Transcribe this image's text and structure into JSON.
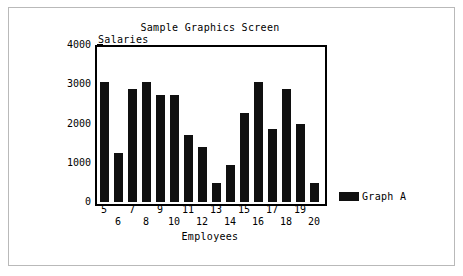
{
  "chart_data": {
    "type": "bar",
    "title": "Sample Graphics Screen",
    "xlabel": "Employees",
    "ylabel": "Salaries",
    "categories": [
      "5",
      "6",
      "7",
      "8",
      "9",
      "10",
      "11",
      "12",
      "13",
      "14",
      "15",
      "16",
      "17",
      "18",
      "19",
      "20"
    ],
    "values": [
      3050,
      1250,
      2880,
      3050,
      2720,
      2720,
      1700,
      1400,
      480,
      940,
      2280,
      3050,
      1850,
      2880,
      2000,
      480
    ],
    "series": [
      {
        "name": "Graph A",
        "color": "#101010",
        "values": [
          3050,
          1250,
          2880,
          3050,
          2720,
          2720,
          1700,
          1400,
          480,
          940,
          2280,
          3050,
          1850,
          2880,
          2000,
          480
        ]
      }
    ],
    "ylim": [
      0,
      4000
    ],
    "yticks": [
      0,
      1000,
      2000,
      3000,
      4000
    ],
    "ytick_labels": [
      "0",
      "1000",
      "2000",
      "3000",
      "4000"
    ],
    "y_minor_tick_interval": 250,
    "grid": false,
    "legend": {
      "position": "right-outside",
      "entries": [
        {
          "label": "Graph A",
          "color": "#101010"
        }
      ]
    },
    "colors": {
      "bar": "#101010",
      "axis": "#000000",
      "background": "#ffffff",
      "frame": "#b9b9b9"
    }
  },
  "legend": {
    "label": "Graph A"
  }
}
